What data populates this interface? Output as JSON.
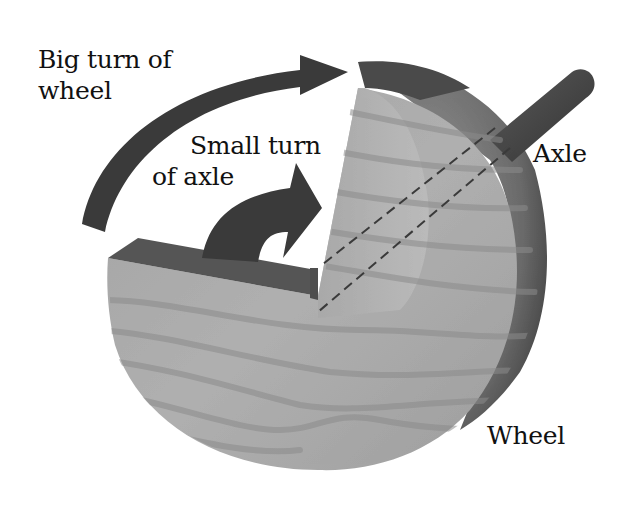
{
  "diagram": {
    "labels": {
      "big_turn": {
        "line1": "Big turn of",
        "line2": "wheel"
      },
      "small_turn": {
        "line1": "Small turn",
        "line2": "of axle"
      },
      "axle": "Axle",
      "wheel": "Wheel"
    },
    "colors": {
      "background": "#ffffff",
      "arrow": "#3a3a3a",
      "wood_face": "#a9a9a9",
      "wood_cut_face": "#b4b4b4",
      "wood_edge": "#555555",
      "axle": "#444444",
      "grain": "#8a8a8a",
      "text": "#111111"
    }
  }
}
